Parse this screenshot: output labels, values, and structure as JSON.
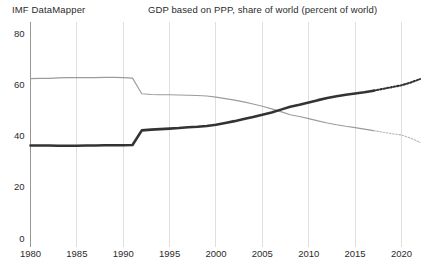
{
  "header": {
    "brand": "IMF DataMapper",
    "title": "GDP based on PPP, share of world (percent of world)"
  },
  "chart_data": {
    "type": "line",
    "title": "GDP based on PPP, share of world (percent of world)",
    "subtitle": "IMF DataMapper",
    "xlabel": "",
    "ylabel": "",
    "xlim": [
      1980,
      2022
    ],
    "ylim": [
      0,
      80
    ],
    "yticks": [
      0,
      20,
      40,
      60,
      80
    ],
    "ytick_labels": [
      "0",
      "20",
      "40",
      "60",
      "80"
    ],
    "xticks": [
      1980,
      1985,
      1990,
      1995,
      2000,
      2005,
      2010,
      2015,
      2020
    ],
    "xtick_labels": [
      "1980",
      "1985",
      "1990",
      "1995",
      "2000",
      "2005",
      "2010",
      "2015",
      "2020"
    ],
    "minor_xtick_interval": 1,
    "grid": "vertical",
    "legend": "none",
    "x": [
      1980,
      1981,
      1982,
      1983,
      1984,
      1985,
      1986,
      1987,
      1988,
      1989,
      1990,
      1991,
      1992,
      1993,
      1994,
      1995,
      1996,
      1997,
      1998,
      1999,
      2000,
      2001,
      2002,
      2003,
      2004,
      2005,
      2006,
      2007,
      2008,
      2009,
      2010,
      2011,
      2012,
      2013,
      2014,
      2015,
      2016,
      2017,
      2018,
      2019,
      2020,
      2021,
      2022
    ],
    "series": [
      {
        "name": "Advanced economies",
        "color": "#9b9b9b",
        "style": "thin-solid",
        "last_actual_year": 2017,
        "values": [
          62.2,
          62.3,
          62.3,
          62.5,
          62.6,
          62.6,
          62.6,
          62.6,
          62.7,
          62.7,
          62.6,
          62.4,
          56.3,
          56.0,
          55.9,
          55.9,
          55.8,
          55.7,
          55.6,
          55.4,
          55.0,
          54.4,
          53.8,
          53.1,
          52.3,
          51.4,
          50.4,
          49.3,
          48.1,
          47.4,
          46.6,
          45.7,
          44.9,
          44.2,
          43.6,
          43.1,
          42.5,
          41.9,
          41.3,
          40.7,
          40.2,
          39.0,
          37.3
        ]
      },
      {
        "name": "Emerging market and developing economies",
        "color": "#333333",
        "style": "thick-solid",
        "last_actual_year": 2017,
        "values": [
          36.1,
          36.1,
          36.1,
          36.0,
          36.0,
          36.0,
          36.1,
          36.1,
          36.2,
          36.2,
          36.2,
          36.3,
          42.0,
          42.3,
          42.5,
          42.7,
          42.9,
          43.2,
          43.4,
          43.7,
          44.2,
          44.9,
          45.6,
          46.4,
          47.2,
          48.1,
          49.0,
          50.1,
          51.2,
          52.0,
          52.9,
          53.8,
          54.6,
          55.3,
          55.9,
          56.4,
          56.9,
          57.5,
          58.2,
          58.9,
          59.6,
          60.7,
          62.0
        ]
      }
    ]
  }
}
